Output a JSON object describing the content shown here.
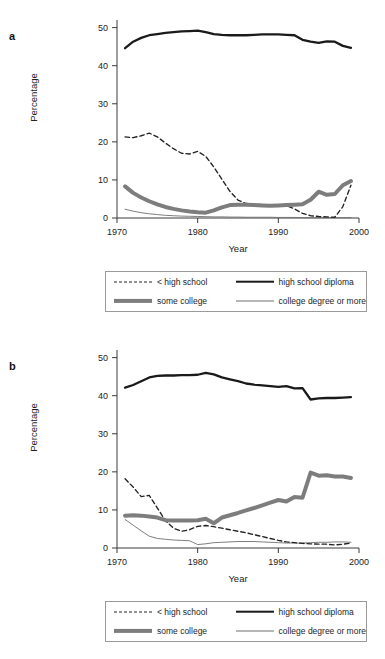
{
  "figure": {
    "panels": [
      {
        "key": "a",
        "label": "a"
      },
      {
        "key": "b",
        "label": "b"
      }
    ]
  },
  "axis": {
    "ylabel": "Percentage",
    "xlabel": "Year",
    "xticks": [
      "1970",
      "1980",
      "1990",
      "2000"
    ],
    "yticks": [
      "0",
      "10",
      "20",
      "30",
      "40",
      "50"
    ]
  },
  "legend": {
    "items": [
      {
        "label": "< high school",
        "style": "dashed",
        "color": "#222222"
      },
      {
        "label": "high school diploma",
        "style": "thick",
        "color": "#1a1a1a"
      },
      {
        "label": "some college",
        "style": "gray",
        "color": "#7d7d7d"
      },
      {
        "label": "college degree or more",
        "style": "thin",
        "color": "#6f6f6f"
      }
    ]
  },
  "chart_data": [
    {
      "type": "line",
      "panel": "a",
      "title": "",
      "xlabel": "Year",
      "ylabel": "Percentage",
      "xlim": [
        1970,
        2000
      ],
      "ylim": [
        0,
        52
      ],
      "xticks": [
        1970,
        1980,
        1990,
        2000
      ],
      "yticks": [
        0,
        10,
        20,
        30,
        40,
        50
      ],
      "grid": false,
      "legend_position": "below-plot",
      "x": [
        1971,
        1972,
        1973,
        1974,
        1975,
        1976,
        1977,
        1978,
        1979,
        1980,
        1981,
        1982,
        1983,
        1984,
        1985,
        1986,
        1987,
        1988,
        1989,
        1990,
        1991,
        1992,
        1993,
        1994,
        1995,
        1996,
        1997,
        1998,
        1999
      ],
      "series": [
        {
          "name": "high school diploma",
          "style": "thick",
          "color": "#1a1a1a",
          "values": [
            44.6,
            46.3,
            47.3,
            48.0,
            48.3,
            48.6,
            48.8,
            49.0,
            49.1,
            49.2,
            48.8,
            48.3,
            48.1,
            48.0,
            48.0,
            48.0,
            48.1,
            48.2,
            48.2,
            48.2,
            48.1,
            48.0,
            46.8,
            46.3,
            46.0,
            46.4,
            46.3,
            45.2,
            44.7
          ]
        },
        {
          "name": "< high school",
          "style": "dashed",
          "color": "#222222",
          "values": [
            21.3,
            21.1,
            21.6,
            22.3,
            21.3,
            19.7,
            18.2,
            17.0,
            16.8,
            17.5,
            16.2,
            13.4,
            10.2,
            7.0,
            4.7,
            3.8,
            3.6,
            3.5,
            3.3,
            3.3,
            3.3,
            2.4,
            1.2,
            0.6,
            0.4,
            0.3,
            0.2,
            3.0,
            8.6
          ]
        },
        {
          "name": "some college",
          "style": "gray",
          "color": "#7d7d7d",
          "values": [
            8.3,
            6.6,
            5.4,
            4.4,
            3.6,
            2.9,
            2.4,
            2.0,
            1.7,
            1.5,
            1.4,
            2.0,
            2.8,
            3.4,
            3.5,
            3.5,
            3.4,
            3.3,
            3.2,
            3.3,
            3.4,
            3.5,
            3.6,
            4.8,
            6.9,
            6.1,
            6.3,
            8.6,
            9.7
          ]
        },
        {
          "name": "college degree or more",
          "style": "thin",
          "color": "#6f6f6f",
          "values": [
            2.3,
            1.8,
            1.4,
            1.1,
            0.9,
            0.7,
            0.6,
            0.5,
            0.45,
            0.4,
            0.35,
            0.3,
            0.3,
            0.25,
            0.25,
            0.2,
            0.2,
            0.2,
            0.2,
            0.15,
            0.15,
            0.15,
            0.1,
            0.1,
            0.1,
            0.1,
            0.1,
            0.1,
            0.1
          ]
        }
      ]
    },
    {
      "type": "line",
      "panel": "b",
      "title": "",
      "xlabel": "Year",
      "ylabel": "Percentage",
      "xlim": [
        1970,
        2000
      ],
      "ylim": [
        0,
        52
      ],
      "xticks": [
        1970,
        1980,
        1990,
        2000
      ],
      "yticks": [
        0,
        10,
        20,
        30,
        40,
        50
      ],
      "grid": false,
      "legend_position": "below-plot",
      "x": [
        1971,
        1972,
        1973,
        1974,
        1975,
        1976,
        1977,
        1978,
        1979,
        1980,
        1981,
        1982,
        1983,
        1984,
        1985,
        1986,
        1987,
        1988,
        1989,
        1990,
        1991,
        1992,
        1993,
        1994,
        1995,
        1996,
        1997,
        1998,
        1999
      ],
      "series": [
        {
          "name": "high school diploma",
          "style": "thick",
          "color": "#1a1a1a",
          "values": [
            42.1,
            42.8,
            43.8,
            44.8,
            45.2,
            45.3,
            45.3,
            45.4,
            45.4,
            45.5,
            46.0,
            45.6,
            44.8,
            44.3,
            43.8,
            43.2,
            42.9,
            42.7,
            42.5,
            42.3,
            42.5,
            41.9,
            42.0,
            39.0,
            39.3,
            39.4,
            39.4,
            39.5,
            39.6
          ]
        },
        {
          "name": "< high school",
          "style": "dashed",
          "color": "#222222",
          "values": [
            18.2,
            16.0,
            13.5,
            13.8,
            10.5,
            7.2,
            5.2,
            4.4,
            4.8,
            5.7,
            5.9,
            5.6,
            5.2,
            4.8,
            4.4,
            4.0,
            3.5,
            3.0,
            2.5,
            2.0,
            1.6,
            1.4,
            1.2,
            1.1,
            1.0,
            1.0,
            0.8,
            1.0,
            1.3
          ]
        },
        {
          "name": "some college",
          "style": "gray",
          "color": "#7d7d7d",
          "values": [
            8.5,
            8.6,
            8.5,
            8.3,
            8.0,
            7.3,
            7.2,
            7.2,
            7.2,
            7.3,
            7.7,
            6.5,
            8.0,
            8.6,
            9.2,
            9.9,
            10.5,
            11.2,
            11.9,
            12.6,
            12.2,
            13.4,
            13.2,
            19.8,
            19.0,
            19.1,
            18.8,
            18.8,
            18.4
          ]
        },
        {
          "name": "college degree or more",
          "style": "thin",
          "color": "#6f6f6f",
          "values": [
            7.5,
            6.0,
            4.5,
            3.1,
            2.5,
            2.3,
            2.1,
            2.0,
            1.9,
            0.9,
            1.1,
            1.4,
            1.5,
            1.6,
            1.7,
            1.7,
            1.7,
            1.6,
            1.5,
            1.4,
            1.3,
            1.3,
            1.3,
            1.4,
            1.5,
            1.5,
            1.6,
            1.6,
            1.5
          ]
        }
      ]
    }
  ]
}
